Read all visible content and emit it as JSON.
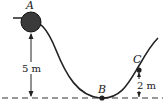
{
  "diagram": {
    "type": "roller-coaster-track",
    "points": [
      {
        "id": "A",
        "label": "A",
        "description": "ball at top of track"
      },
      {
        "id": "B",
        "label": "B",
        "description": "lowest point on ground"
      },
      {
        "id": "C",
        "label": "C",
        "description": "point on rising slope"
      }
    ],
    "dimensions": [
      {
        "from": "A",
        "to": "ground",
        "label": "5 m"
      },
      {
        "from": "C",
        "to": "ground",
        "label": "2 m"
      }
    ],
    "colors": {
      "line": "#222222",
      "ball": "#3a3a3a",
      "ground": "#333333"
    }
  }
}
